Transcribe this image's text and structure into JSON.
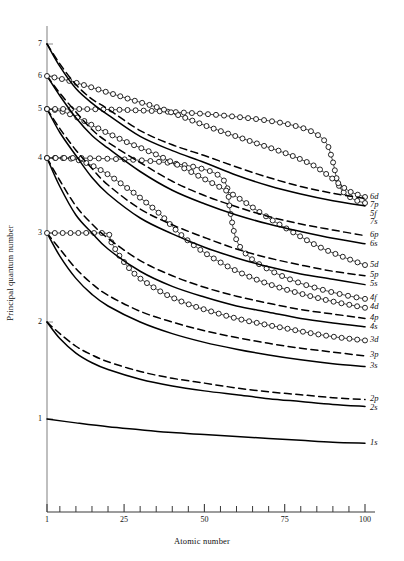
{
  "chart_data": {
    "type": "line",
    "title": "",
    "xlabel": "Atomic number",
    "ylabel": "Principal quantum number",
    "xlim": [
      1,
      100
    ],
    "ylim": [
      0.3,
      7.6
    ],
    "grid": false,
    "legend_position": "right-inline-labels",
    "x_ticks_major": [
      1,
      25,
      50,
      75,
      100
    ],
    "x_tick_labels": [
      "1",
      "25",
      "50",
      "75",
      "100"
    ],
    "x_ticks_minor": [
      5,
      10,
      15,
      20,
      30,
      35,
      40,
      45,
      55,
      60,
      65,
      70,
      80,
      85,
      90,
      95
    ],
    "y_ticks": [
      1,
      2,
      3,
      4,
      5,
      6,
      7
    ],
    "y_tick_labels": [
      "1",
      "2",
      "3",
      "4",
      "5",
      "6",
      "7"
    ],
    "marker_style_note": "open circles mark d and f orbitals",
    "line_style_note": "solid = s orbitals, dashed = p orbitals",
    "series": [
      {
        "name": "1s",
        "label": "1s",
        "style": "solid",
        "marker": "none",
        "x": [
          1,
          10,
          20,
          30,
          40,
          50,
          60,
          70,
          80,
          90,
          100
        ],
        "y": [
          1.0,
          0.96,
          0.92,
          0.89,
          0.86,
          0.84,
          0.82,
          0.8,
          0.78,
          0.76,
          0.75
        ]
      },
      {
        "name": "2s",
        "label": "2s",
        "style": "solid",
        "marker": "none",
        "x": [
          1,
          5,
          10,
          15,
          20,
          30,
          40,
          50,
          60,
          70,
          80,
          90,
          100
        ],
        "y": [
          2.0,
          1.83,
          1.68,
          1.58,
          1.51,
          1.41,
          1.34,
          1.29,
          1.25,
          1.21,
          1.18,
          1.15,
          1.13
        ]
      },
      {
        "name": "2p",
        "label": "2p",
        "style": "dashed",
        "marker": "none",
        "x": [
          1,
          5,
          10,
          15,
          20,
          30,
          40,
          50,
          60,
          70,
          80,
          90,
          100
        ],
        "y": [
          2.0,
          1.88,
          1.75,
          1.66,
          1.59,
          1.49,
          1.42,
          1.37,
          1.32,
          1.28,
          1.25,
          1.22,
          1.2
        ]
      },
      {
        "name": "3s",
        "label": "3s",
        "style": "solid",
        "marker": "none",
        "x": [
          1,
          5,
          10,
          15,
          20,
          30,
          40,
          50,
          60,
          70,
          80,
          90,
          100
        ],
        "y": [
          3.0,
          2.74,
          2.49,
          2.31,
          2.18,
          2.0,
          1.88,
          1.79,
          1.72,
          1.66,
          1.61,
          1.57,
          1.54
        ]
      },
      {
        "name": "3p",
        "label": "3p",
        "style": "dashed",
        "marker": "none",
        "x": [
          1,
          5,
          10,
          15,
          20,
          30,
          40,
          50,
          60,
          70,
          80,
          90,
          100
        ],
        "y": [
          3.0,
          2.82,
          2.6,
          2.43,
          2.3,
          2.12,
          2.0,
          1.91,
          1.84,
          1.78,
          1.73,
          1.69,
          1.65
        ]
      },
      {
        "name": "3d",
        "label": "3d",
        "style": "solid",
        "marker": "circle",
        "x": [
          1,
          5,
          10,
          15,
          20,
          21,
          24,
          28,
          32,
          38,
          45,
          52,
          60,
          68,
          76,
          84,
          92,
          100
        ],
        "y": [
          3.0,
          3.0,
          3.0,
          3.0,
          2.99,
          2.9,
          2.72,
          2.55,
          2.44,
          2.31,
          2.2,
          2.12,
          2.04,
          1.98,
          1.93,
          1.88,
          1.84,
          1.81
        ]
      },
      {
        "name": "4s",
        "label": "4s",
        "style": "solid",
        "marker": "none",
        "x": [
          1,
          5,
          10,
          15,
          20,
          30,
          40,
          50,
          60,
          70,
          80,
          90,
          100
        ],
        "y": [
          4.0,
          3.62,
          3.24,
          3.0,
          2.82,
          2.57,
          2.4,
          2.28,
          2.18,
          2.11,
          2.04,
          1.99,
          1.95
        ]
      },
      {
        "name": "4p",
        "label": "4p",
        "style": "dashed",
        "marker": "none",
        "x": [
          1,
          5,
          10,
          15,
          20,
          30,
          40,
          50,
          60,
          70,
          80,
          90,
          100
        ],
        "y": [
          4.0,
          3.7,
          3.36,
          3.12,
          2.94,
          2.69,
          2.52,
          2.39,
          2.29,
          2.21,
          2.14,
          2.09,
          2.04
        ]
      },
      {
        "name": "4d",
        "label": "4d",
        "style": "solid",
        "marker": "circle",
        "x": [
          1,
          5,
          10,
          15,
          20,
          25,
          30,
          36,
          39,
          44,
          50,
          58,
          66,
          74,
          82,
          90,
          100
        ],
        "y": [
          4.0,
          4.0,
          3.98,
          3.9,
          3.78,
          3.63,
          3.47,
          3.26,
          3.13,
          2.94,
          2.78,
          2.61,
          2.48,
          2.38,
          2.3,
          2.23,
          2.16
        ]
      },
      {
        "name": "4f",
        "label": "4f",
        "style": "solid",
        "marker": "circle",
        "x": [
          1,
          10,
          20,
          30,
          40,
          48,
          54,
          57,
          58,
          60,
          64,
          70,
          78,
          86,
          94,
          100
        ],
        "y": [
          4.0,
          4.0,
          3.99,
          3.97,
          3.93,
          3.87,
          3.78,
          3.62,
          3.3,
          2.92,
          2.73,
          2.59,
          2.46,
          2.37,
          2.3,
          2.26
        ]
      },
      {
        "name": "5s",
        "label": "5s",
        "style": "solid",
        "marker": "none",
        "x": [
          1,
          5,
          10,
          15,
          20,
          30,
          40,
          50,
          60,
          70,
          80,
          90,
          100
        ],
        "y": [
          5.0,
          4.52,
          4.05,
          3.74,
          3.52,
          3.2,
          2.99,
          2.84,
          2.72,
          2.62,
          2.54,
          2.48,
          2.42
        ]
      },
      {
        "name": "5p",
        "label": "5p",
        "style": "dashed",
        "marker": "none",
        "x": [
          1,
          5,
          10,
          15,
          20,
          30,
          40,
          50,
          60,
          70,
          80,
          90,
          100
        ],
        "y": [
          5.0,
          4.6,
          4.16,
          3.86,
          3.64,
          3.32,
          3.11,
          2.95,
          2.82,
          2.72,
          2.64,
          2.57,
          2.52
        ]
      },
      {
        "name": "5d",
        "label": "5d",
        "style": "solid",
        "marker": "circle",
        "x": [
          1,
          5,
          10,
          18,
          26,
          34,
          42,
          50,
          57,
          63,
          70,
          78,
          86,
          94,
          100
        ],
        "y": [
          5.0,
          4.96,
          4.84,
          4.57,
          4.32,
          4.1,
          3.9,
          3.72,
          3.56,
          3.4,
          3.2,
          3.0,
          2.84,
          2.72,
          2.64
        ]
      },
      {
        "name": "5f",
        "label": "5f",
        "style": "solid",
        "marker": "circle",
        "x": [
          1,
          10,
          20,
          30,
          40,
          50,
          60,
          70,
          78,
          84,
          88,
          90,
          92,
          96,
          100
        ],
        "y": [
          5.0,
          5.0,
          4.99,
          4.97,
          4.94,
          4.9,
          4.84,
          4.76,
          4.66,
          4.52,
          4.3,
          3.95,
          3.62,
          3.46,
          3.4
        ]
      },
      {
        "name": "6s",
        "label": "6s",
        "style": "solid",
        "marker": "none",
        "x": [
          1,
          5,
          10,
          15,
          20,
          30,
          40,
          50,
          60,
          70,
          80,
          90,
          100
        ],
        "y": [
          6.0,
          5.4,
          4.82,
          4.46,
          4.2,
          3.82,
          3.57,
          3.39,
          3.24,
          3.12,
          3.02,
          2.94,
          2.88
        ]
      },
      {
        "name": "6p",
        "label": "6p",
        "style": "dashed",
        "marker": "none",
        "x": [
          1,
          5,
          10,
          15,
          20,
          30,
          40,
          50,
          60,
          70,
          80,
          90,
          100
        ],
        "y": [
          6.0,
          5.48,
          4.94,
          4.58,
          4.32,
          3.94,
          3.69,
          3.5,
          3.35,
          3.22,
          3.12,
          3.04,
          2.97
        ]
      },
      {
        "name": "6d",
        "label": "6d",
        "style": "solid",
        "marker": "circle",
        "x": [
          1,
          6,
          12,
          20,
          28,
          36,
          44,
          52,
          60,
          68,
          76,
          84,
          90,
          95,
          100
        ],
        "y": [
          6.0,
          5.9,
          5.74,
          5.5,
          5.26,
          5.03,
          4.82,
          4.62,
          4.44,
          4.26,
          4.08,
          3.9,
          3.72,
          3.56,
          3.48
        ]
      },
      {
        "name": "7s",
        "label": "7s",
        "style": "solid",
        "marker": "none",
        "x": [
          1,
          5,
          10,
          15,
          20,
          30,
          40,
          50,
          60,
          70,
          80,
          90,
          100
        ],
        "y": [
          7.0,
          6.3,
          5.62,
          5.18,
          4.88,
          4.44,
          4.15,
          3.94,
          3.77,
          3.63,
          3.52,
          3.43,
          3.36
        ]
      },
      {
        "name": "7p",
        "label": "7p",
        "style": "dashed",
        "marker": "none",
        "x": [
          1,
          5,
          10,
          15,
          20,
          30,
          40,
          50,
          60,
          70,
          80,
          90,
          100
        ],
        "y": [
          7.0,
          6.38,
          5.74,
          5.3,
          5.0,
          4.56,
          4.27,
          4.05,
          3.88,
          3.74,
          3.62,
          3.53,
          3.46
        ]
      }
    ]
  },
  "labels": {
    "x_axis": "Atomic number",
    "y_axis": "Principal quantum number"
  }
}
